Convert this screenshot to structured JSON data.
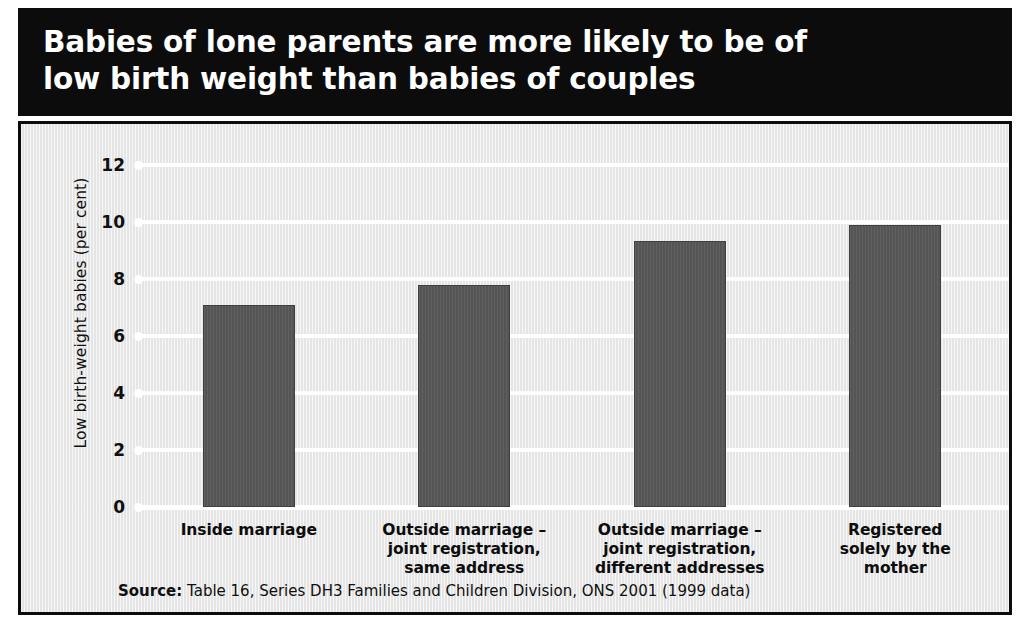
{
  "title": "Babies of lone parents are more likely to be of\nlow birth weight than babies of couples",
  "source": {
    "label": "Source:",
    "text": " Table 16, Series DH3 Families and Children Division, ONS 2001 (1999 data)"
  },
  "colors": {
    "banner_background": "#0c0c0c",
    "banner_text": "#ffffff",
    "plot_background": "#ededed",
    "gridline": "#ffffff",
    "bar_fill": "#595959",
    "bar_edge": "#3f3f3f",
    "frame_border": "#0c0c0c"
  },
  "chart_data": {
    "type": "bar",
    "title": "Babies of lone parents are more likely to be of low birth weight than babies of couples",
    "categories": [
      "Inside marriage",
      "Outside marriage –\njoint registration,\nsame address",
      "Outside marriage –\njoint registration,\ndifferent addresses",
      "Registered\nsolely by the\nmother"
    ],
    "values": [
      7.1,
      7.8,
      9.35,
      9.9
    ],
    "xlabel": "",
    "ylabel": "Low birth-weight babies (per cent)",
    "ylim": [
      0,
      12
    ],
    "yticks": [
      0,
      2,
      4,
      6,
      8,
      10,
      12
    ],
    "ytick_labels": [
      "0",
      "2",
      "4",
      "6",
      "8",
      "10",
      "12"
    ],
    "grid": true,
    "grid_axis": "y",
    "legend": false,
    "bar_color": "#595959",
    "source": "Source: Table 16, Series DH3 Families and Children Division, ONS 2001 (1999 data)"
  }
}
